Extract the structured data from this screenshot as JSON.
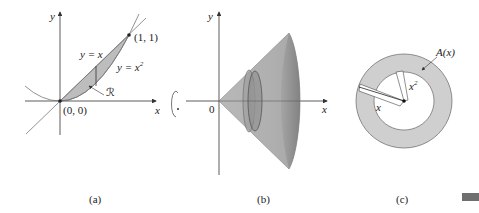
{
  "figure": {
    "panels": [
      {
        "id": "a",
        "caption": "(a)",
        "axis_labels": {
          "x": "x",
          "y": "y"
        },
        "curves": [
          {
            "name": "line",
            "label": "y = x"
          },
          {
            "name": "parabola",
            "label": "y = x²",
            "label_base": "y = x",
            "label_sup": "2"
          }
        ],
        "points": [
          {
            "name": "origin",
            "label": "(0, 0)"
          },
          {
            "name": "intersection",
            "label": "(1, 1)"
          }
        ],
        "region_label": "ℛ"
      },
      {
        "id": "b",
        "caption": "(b)",
        "axis_labels": {
          "x": "x",
          "y": "y"
        },
        "origin_label": "0",
        "rotation_icon": "rotation-about-x-axis"
      },
      {
        "id": "c",
        "caption": "(c)",
        "area_label": "A(x)",
        "outer_radius_label": "x",
        "inner_radius_label": "x²",
        "inner_radius_base": "x",
        "inner_radius_sup": "2"
      }
    ],
    "colors": {
      "shade": "#bdbdbd",
      "cone": "#a9a9a9",
      "cone_dark": "#8e8e8e",
      "washer": "#cfcfcf",
      "ink": "#333333",
      "corner_bar": "#6f6f6f"
    }
  }
}
